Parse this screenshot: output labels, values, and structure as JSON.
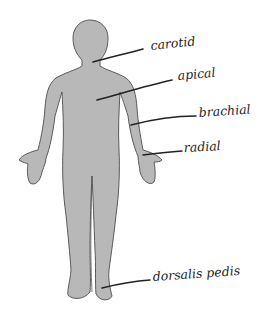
{
  "diagram": {
    "colors": {
      "background": "#ffffff",
      "body_fill": "#b8b8b8",
      "body_outline": "#5a5a5a",
      "leader_line": "#222222",
      "label_text": "#1e1e1e"
    },
    "labels": [
      {
        "id": "carotid",
        "text": "carotid"
      },
      {
        "id": "apical",
        "text": "apical"
      },
      {
        "id": "brachial",
        "text": "brachial"
      },
      {
        "id": "radial",
        "text": "radial"
      },
      {
        "id": "dorsalis-pedis",
        "text": "dorsalis pedis"
      }
    ]
  }
}
